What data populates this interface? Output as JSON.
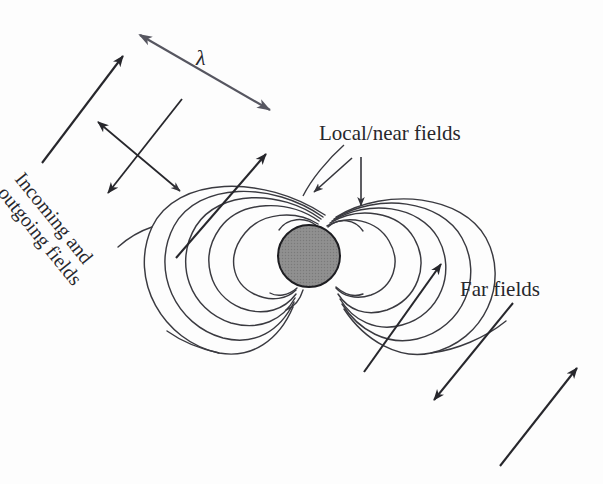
{
  "figure": {
    "background_color": "#fdfdfd",
    "width": 603,
    "height": 484
  },
  "labels": {
    "local_near_fields": "Local/near fields",
    "far_fields": "Far fields",
    "wavelength_symbol": "λ",
    "incoming_line1": "Incoming and",
    "incoming_line2": "outgoing fields"
  },
  "colors": {
    "stroke": "#27272c",
    "field_line": "#3a3a40",
    "sphere_fill": "#8d8d8d",
    "sphere_stroke": "#1d1d21",
    "lambda_arrow": "#4e4e54",
    "text": "#27272c"
  },
  "sphere": {
    "center_x": 309,
    "center_y": 256,
    "radius": 31
  },
  "diagram_data": {
    "type": "diagram",
    "subject": "electromagnetic dipole radiation",
    "elements": [
      {
        "name": "source-sphere",
        "kind": "filled-circle",
        "cx": 309,
        "cy": 256,
        "r": 31
      },
      {
        "name": "dipole-field-lines",
        "kind": "curves",
        "count": 12,
        "description": "closed dipole loops converging at sphere poles"
      },
      {
        "name": "incoming-outgoing-arrow-long",
        "kind": "single-arrow",
        "from": [
          42,
          163
        ],
        "to": [
          123,
          56
        ]
      },
      {
        "name": "incoming-outgoing-arrow-mid",
        "kind": "single-arrow",
        "from": [
          176,
          258
        ],
        "to": [
          266,
          154
        ]
      },
      {
        "name": "polarization-cross-arrow-a",
        "kind": "double-arrow",
        "from": [
          98,
          122
        ],
        "to": [
          180,
          191
        ]
      },
      {
        "name": "polarization-cross-arrow-b",
        "kind": "double-arrow",
        "from": [
          182,
          99
        ],
        "to": [
          108,
          193
        ]
      },
      {
        "name": "wavelength-double-arrow",
        "kind": "double-arrow",
        "from": [
          138,
          33
        ],
        "to": [
          272,
          112
        ]
      },
      {
        "name": "far-field-arrow-upper",
        "kind": "single-arrow",
        "from": [
          364,
          372
        ],
        "to": [
          441,
          264
        ]
      },
      {
        "name": "far-field-arrow-lower",
        "kind": "single-arrow",
        "from": [
          500,
          466
        ],
        "to": [
          577,
          368
        ]
      },
      {
        "name": "far-field-polarization-arrow",
        "kind": "single-arrow",
        "from": [
          513,
          303
        ],
        "to": [
          434,
          400
        ]
      },
      {
        "name": "local-fields-leader-diagonal",
        "kind": "single-arrow",
        "from": [
          352,
          160
        ],
        "to": [
          315,
          192
        ]
      },
      {
        "name": "local-fields-leader-vertical",
        "kind": "single-arrow",
        "from": [
          361,
          159
        ],
        "to": [
          361,
          208
        ]
      }
    ]
  }
}
